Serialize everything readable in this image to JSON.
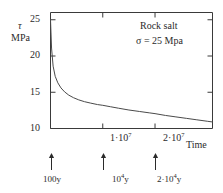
{
  "chart_data": {
    "type": "line",
    "title": "",
    "xlabel": "Time",
    "ylabel_lines": [
      "τ",
      "MPa"
    ],
    "xlim": [
      0,
      31000000
    ],
    "ylim": [
      10,
      26
    ],
    "grid": false,
    "legend": "none",
    "annotations": [
      "Rock salt",
      "σ = 25 Mpa"
    ],
    "yticks": [
      {
        "value": 25,
        "label": "25"
      },
      {
        "value": 20,
        "label": "20"
      },
      {
        "value": 15,
        "label": "15"
      },
      {
        "value": 10,
        "label": "10"
      }
    ],
    "xticks": [
      {
        "value": 10000000,
        "mantissa": "1·10",
        "exponent": "7"
      },
      {
        "value": 20000000,
        "mantissa": "2·10",
        "exponent": "7"
      }
    ],
    "arrow_markers": [
      {
        "x": 0,
        "mantissa": "100y",
        "exponent": ""
      },
      {
        "x": 10000000,
        "mantissa": "10",
        "exponent": "4",
        "suffix": "y"
      },
      {
        "x": 20000000,
        "mantissa": "2·10",
        "exponent": "4",
        "suffix": "y"
      }
    ],
    "series": [
      {
        "name": "relaxation",
        "x": [
          0,
          200000,
          500000,
          900000,
          1400000,
          2000000,
          2700000,
          3500000,
          4400000,
          5400000,
          6500000,
          7700000,
          9000000,
          10000000,
          11500000,
          13000000,
          15000000,
          17000000,
          19000000,
          20000000,
          22000000,
          24000000,
          26000000,
          28000000,
          30000000,
          31000000
        ],
        "y": [
          25.0,
          21.1,
          18.6,
          17.2,
          16.3,
          15.6,
          15.05,
          14.6,
          14.25,
          13.95,
          13.7,
          13.5,
          13.3,
          13.2,
          13.0,
          12.8,
          12.55,
          12.35,
          12.15,
          12.05,
          11.8,
          11.6,
          11.4,
          11.2,
          11.0,
          10.9
        ]
      }
    ],
    "colors": {
      "axis": "#3a3a3a",
      "curve": "#4a4a4a",
      "text": "#2b2b2b",
      "background": "#ffffff"
    }
  }
}
